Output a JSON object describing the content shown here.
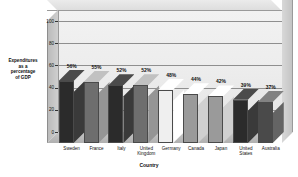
{
  "chart_data": {
    "type": "bar",
    "title": "",
    "xlabel": "Country",
    "ylabel": "Expenditures as a percentage of GDP",
    "ylabel_lines": [
      "Expenditures",
      "as a",
      "percentage",
      "of GDP"
    ],
    "categories": [
      "Sweden",
      "France",
      "Italy",
      "United Kingdom",
      "Germany",
      "Canada",
      "Japan",
      "United States",
      "Australia"
    ],
    "category_lines": [
      [
        "Sweden"
      ],
      [
        "France"
      ],
      [
        "Italy"
      ],
      [
        "United",
        "Kingdom"
      ],
      [
        "Germany"
      ],
      [
        "Canada"
      ],
      [
        "Japan"
      ],
      [
        "United",
        "States"
      ],
      [
        "Australia"
      ]
    ],
    "values": [
      56,
      55,
      52,
      52,
      48,
      44,
      42,
      39,
      37
    ],
    "data_labels": [
      "56%",
      "55%",
      "52%",
      "52%",
      "48%",
      "44%",
      "42%",
      "39%",
      "37%"
    ],
    "ylim": [
      0,
      110
    ],
    "yticks": [
      0,
      20,
      40,
      60,
      80,
      100
    ],
    "ytick_labels": [
      "0",
      "20",
      "40",
      "60",
      "80",
      "100"
    ],
    "grid": true,
    "legend": false,
    "style": "3d-column",
    "bar_colors": [
      "#2b2b2b",
      "#6e6e6e",
      "#2b2b2b",
      "#6e6e6e",
      "#efefef",
      "#9a9a9a",
      "#9a9a9a",
      "#2b2b2b",
      "#4a4a4a"
    ],
    "plot_background": "#ededed",
    "floor_color": "#bcbcbc",
    "gridline_color": "#8f8f8f"
  }
}
